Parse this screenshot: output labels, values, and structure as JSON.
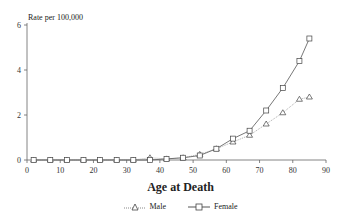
{
  "chart_data": {
    "type": "line",
    "title": "",
    "ylabel": "Rate per 100,000",
    "xlabel": "Age at Death",
    "xlim": [
      0,
      90
    ],
    "ylim": [
      0,
      6
    ],
    "x_ticks": [
      0,
      10,
      20,
      30,
      40,
      50,
      60,
      70,
      80,
      90
    ],
    "y_ticks": [
      0,
      2,
      4,
      6
    ],
    "grid": false,
    "legend_position": "bottom",
    "x": [
      2,
      7,
      12,
      17,
      22,
      27,
      32,
      37,
      42,
      47,
      52,
      57,
      62,
      67,
      72,
      77,
      82,
      85
    ],
    "series": [
      {
        "name": "Male",
        "marker": "triangle",
        "line": "dotted",
        "values": [
          0.0,
          0.0,
          0.0,
          0.0,
          0.0,
          0.0,
          0.0,
          0.1,
          0.05,
          0.1,
          0.25,
          0.5,
          0.8,
          1.1,
          1.6,
          2.1,
          2.7,
          2.8
        ]
      },
      {
        "name": "Female",
        "marker": "square",
        "line": "solid",
        "values": [
          0.0,
          0.0,
          0.0,
          0.0,
          0.0,
          0.0,
          0.0,
          0.0,
          0.05,
          0.1,
          0.2,
          0.5,
          0.95,
          1.3,
          2.2,
          3.2,
          4.4,
          5.4
        ]
      }
    ]
  },
  "labels": {
    "ylabel": "Rate per 100,000",
    "xlabel": "Age at Death",
    "legend_male": "Male",
    "legend_female": "Female"
  }
}
